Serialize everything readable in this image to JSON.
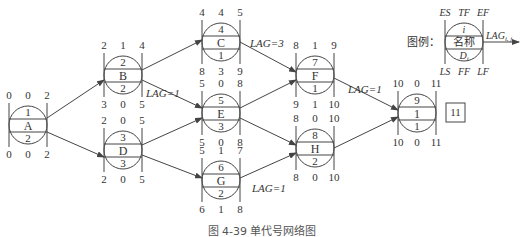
{
  "figure": {
    "caption": "图 4-39  单代号网络图"
  },
  "legend": {
    "label": "图例：",
    "top": [
      "ES",
      "TF",
      "EF"
    ],
    "id": "i",
    "name": "名称",
    "duration": "D_i",
    "bottom": [
      "LS",
      "FF",
      "LF"
    ],
    "lag": "LAG_i,j"
  },
  "nodes": [
    {
      "key": "A",
      "id": "1",
      "name": "A",
      "duration": "2",
      "ES": "0",
      "TF": "0",
      "EF": "2",
      "LS": "0",
      "FF": "0",
      "LF": "2"
    },
    {
      "key": "B",
      "id": "2",
      "name": "B",
      "duration": "2",
      "ES": "2",
      "TF": "1",
      "EF": "4",
      "LS": "3",
      "FF": "0",
      "LF": "5"
    },
    {
      "key": "D",
      "id": "3",
      "name": "D",
      "duration": "3",
      "ES": "2",
      "TF": "0",
      "EF": "5",
      "LS": "2",
      "FF": "0",
      "LF": "5"
    },
    {
      "key": "C",
      "id": "4",
      "name": "C",
      "duration": "1",
      "ES": "4",
      "TF": "4",
      "EF": "5",
      "LS": "8",
      "FF": "3",
      "LF": "9"
    },
    {
      "key": "E",
      "id": "5",
      "name": "E",
      "duration": "3",
      "ES": "5",
      "TF": "0",
      "EF": "8",
      "LS": "5",
      "FF": "0",
      "LF": "8"
    },
    {
      "key": "G",
      "id": "6",
      "name": "G",
      "duration": "2",
      "ES": "5",
      "TF": "1",
      "EF": "7",
      "LS": "6",
      "FF": "1",
      "LF": "8"
    },
    {
      "key": "F",
      "id": "7",
      "name": "F",
      "duration": "1",
      "ES": "8",
      "TF": "1",
      "EF": "9",
      "LS": "9",
      "FF": "1",
      "LF": "10"
    },
    {
      "key": "H",
      "id": "8",
      "name": "H",
      "duration": "2",
      "ES": "8",
      "TF": "0",
      "EF": "10",
      "LS": "8",
      "FF": "0",
      "LF": "10"
    },
    {
      "key": "I",
      "id": "9",
      "name": "1",
      "duration": "1",
      "ES": "10",
      "TF": "0",
      "EF": "11",
      "LS": "10",
      "FF": "0",
      "LF": "11"
    }
  ],
  "lags": {
    "BE": "LAG=1",
    "CF": "LAG=3",
    "FI": "LAG=1",
    "GH": "LAG=1"
  },
  "total_duration": "11"
}
